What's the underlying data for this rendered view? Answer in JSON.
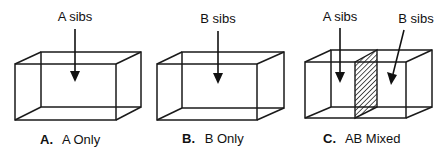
{
  "panels": [
    {
      "id": "A",
      "letter": "A.",
      "caption": "A Only",
      "arrows": [
        {
          "label": "A sibs"
        }
      ]
    },
    {
      "id": "B",
      "letter": "B.",
      "caption": "B Only",
      "arrows": [
        {
          "label": "B sibs"
        }
      ]
    },
    {
      "id": "C",
      "letter": "C.",
      "caption": "AB Mixed",
      "arrows": [
        {
          "label": "A sibs"
        },
        {
          "label": "B sibs"
        }
      ],
      "partition": "hatched"
    }
  ]
}
